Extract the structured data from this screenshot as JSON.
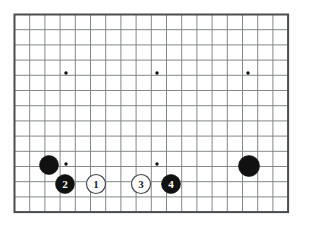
{
  "diagram": {
    "kind": "go-board-diagram",
    "board_size": 19,
    "visible_columns": 19,
    "visible_rows": 14,
    "grid_spacing_px": 15.2,
    "origin_x_px": 14.5,
    "origin_y_px": 14.5,
    "colors": {
      "background": "#ffffff",
      "grid_line": "#767a7d",
      "border_line": "#4a4d50",
      "black_stone": "#111111",
      "white_stone": "#ffffff",
      "white_stone_edge": "#4a4d50",
      "black_label_text": "#ffffff",
      "white_label_text": "#222222",
      "star_point": "#111111"
    },
    "star_points": [
      {
        "name": "star-point-upper-left",
        "col": 3,
        "row": 3,
        "cx": 66,
        "cy": 73
      },
      {
        "name": "star-point-upper-center",
        "col": 9,
        "row": 3,
        "cx": 157,
        "cy": 73
      },
      {
        "name": "star-point-upper-right",
        "col": 15,
        "row": 3,
        "cx": 248,
        "cy": 73
      },
      {
        "name": "star-point-lower-left",
        "col": 3,
        "row": 9,
        "cx": 66,
        "cy": 164
      },
      {
        "name": "star-point-lower-center",
        "col": 9,
        "row": 9,
        "cx": 157,
        "cy": 164
      }
    ],
    "stones": [
      {
        "name": "black-stone-corner-left",
        "color": "black",
        "label": "",
        "col": 2,
        "row": 9,
        "cx": 49,
        "cy": 165,
        "radius": 9.5
      },
      {
        "name": "black-stone-2",
        "color": "black",
        "label": "2",
        "col": 3,
        "row": 10,
        "cx": 65,
        "cy": 184,
        "radius": 9.5
      },
      {
        "name": "white-stone-1",
        "color": "white",
        "label": "1",
        "col": 5,
        "row": 10,
        "cx": 96,
        "cy": 184,
        "radius": 9.5
      },
      {
        "name": "white-stone-3",
        "color": "white",
        "label": "3",
        "col": 8,
        "row": 10,
        "cx": 141,
        "cy": 184,
        "radius": 9.5
      },
      {
        "name": "black-stone-4",
        "color": "black",
        "label": "4",
        "col": 10,
        "row": 10,
        "cx": 171,
        "cy": 184,
        "radius": 9.5
      },
      {
        "name": "black-stone-corner-right",
        "color": "black",
        "label": "",
        "col": 15,
        "row": 9,
        "cx": 249,
        "cy": 166,
        "radius": 10.5
      }
    ],
    "move_sequence": [
      "1",
      "2",
      "3",
      "4"
    ]
  }
}
